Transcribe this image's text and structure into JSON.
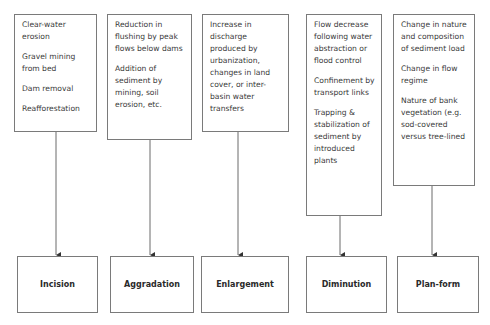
{
  "diagram": {
    "columns": [
      {
        "causes": [
          "Clear-water erosion",
          "Gravel mining from bed",
          "Dam removal",
          "Reafforestation"
        ],
        "effect": "Incision"
      },
      {
        "causes": [
          "Reduction in flushing by peak flows below dams",
          "Addition of sediment by mining, soil erosion, etc."
        ],
        "effect": "Aggradation"
      },
      {
        "causes": [
          "Increase in discharge produced by urbanization, changes in land cover, or inter-basin water transfers"
        ],
        "effect": "Enlargement"
      },
      {
        "causes": [
          "Flow decrease following water abstraction or flood control",
          "Confinement by transport links",
          "Trapping & stabilization of sediment by introduced plants"
        ],
        "effect": "Diminution"
      },
      {
        "causes": [
          "Change in nature and composition of sediment load",
          "Change in flow regime",
          "Nature of bank vegetation (e.g. sod-covered versus tree-lined"
        ],
        "effect": "Plan-form"
      }
    ]
  },
  "colors": {
    "border": "#7a7a7a",
    "text": "#3a3a3a",
    "arrow": "#555555",
    "background": "#ffffff"
  }
}
